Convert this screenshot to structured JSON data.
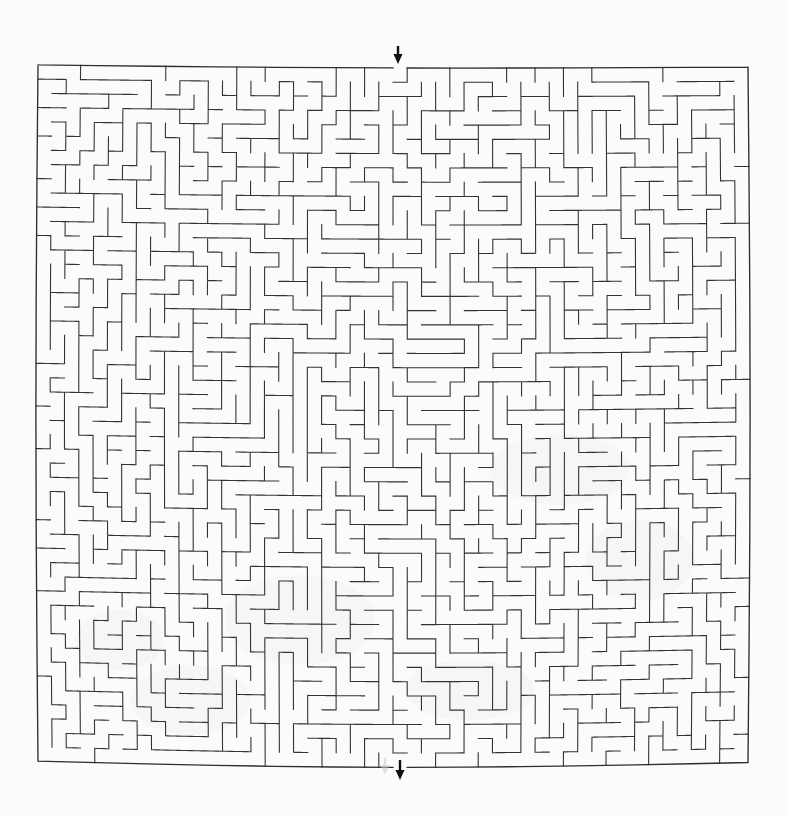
{
  "page": {
    "title": "Maze Puzzle",
    "background_color": "#fbfbfc",
    "width": 789,
    "height": 817
  },
  "maze": {
    "label": "Rectangular perfect maze",
    "wall_color": "#333333",
    "border_color": "#2e2e2e",
    "background_color": "#fbfbfc",
    "origin_x": 38,
    "origin_y": 66,
    "cell_size": 14.2,
    "cols": 50,
    "rows": 49,
    "entrance": {
      "label": "entrance",
      "side": "top",
      "column": 25,
      "arrow_direction": "down",
      "arrow_x": 398,
      "arrow_top": 46,
      "arrow_bottom": 64
    },
    "exit": {
      "label": "exit",
      "side": "bottom",
      "column": 25,
      "arrow_direction": "down",
      "arrow_x": 400,
      "arrow_top": 760,
      "arrow_bottom": 780
    },
    "ghost_artifact": {
      "label": "faint scan ghost arrow",
      "arrow_x": 385,
      "arrow_top": 758,
      "arrow_bottom": 775
    },
    "warp": {
      "label": "scanned page curvature",
      "horizontal_sag_px": 5.5,
      "vertical_bow_px": 3.0
    },
    "seed": 20240517
  }
}
